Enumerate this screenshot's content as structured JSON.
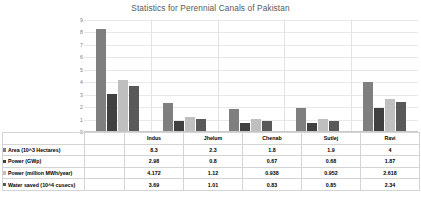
{
  "chart_data": {
    "type": "bar",
    "title": "Statistics for Perennial Canals of Pakistan",
    "xlabel": "",
    "ylabel": "",
    "ylim": [
      0,
      9
    ],
    "yticks": [
      9,
      8,
      7,
      6,
      5,
      4,
      3,
      2,
      1,
      0
    ],
    "grid": true,
    "legend_position": "data-table-left",
    "categories": [
      "Indus",
      "Jhelum",
      "Chenab",
      "Sutlej",
      "Ravi"
    ],
    "series": [
      {
        "name": "Area (10^3 Hectares)",
        "color": "#7f7f7f",
        "values": [
          8.3,
          2.3,
          1.8,
          1.9,
          4
        ],
        "labels": [
          "8.3",
          "2.3",
          "1.8",
          "1.9",
          "4"
        ]
      },
      {
        "name": "Power (GWp)",
        "color": "#404040",
        "values": [
          2.98,
          0.8,
          0.67,
          0.68,
          1.87
        ],
        "labels": [
          "2.98",
          "0.8",
          "0.67",
          "0.68",
          "1.87"
        ]
      },
      {
        "name": "Power (million MWh/year)",
        "color": "#bfbfbf",
        "values": [
          4.172,
          1.12,
          0.938,
          0.952,
          2.618
        ],
        "labels": [
          "4.172",
          "1.12",
          "0.938",
          "0.952",
          "2.618"
        ]
      },
      {
        "name": "Water saved (10^4 cusecs)",
        "color": "#595959",
        "values": [
          3.69,
          1.01,
          0.83,
          0.85,
          2.34
        ],
        "labels": [
          "3.69",
          "1.01",
          "0.83",
          "0.85",
          "2.34"
        ]
      }
    ]
  },
  "table": {
    "legend_labels": [
      "Area (10^3 Hectares)",
      "Power (GWp)",
      "Power (million MWh/year)",
      "Water saved (10^4 cusecs)"
    ]
  }
}
